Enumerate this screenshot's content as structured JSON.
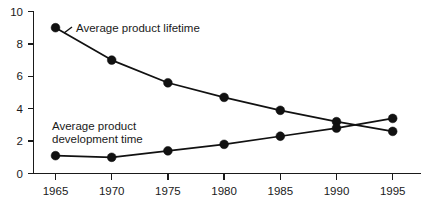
{
  "chart_data": {
    "type": "line",
    "title": "",
    "xlabel": "",
    "ylabel": "",
    "x": [
      1965,
      1970,
      1975,
      1980,
      1985,
      1990,
      1995
    ],
    "xtick_labels": [
      "1965",
      "1970",
      "1975",
      "1980",
      "1985",
      "1990",
      "1995"
    ],
    "ytick_labels": [
      "0",
      "2",
      "4",
      "6",
      "8",
      "10"
    ],
    "yticks": [
      0,
      2,
      4,
      6,
      8,
      10
    ],
    "ylim": [
      0,
      10
    ],
    "xlim": [
      1965,
      1995
    ],
    "grid": false,
    "legend_position": "inline-annotations",
    "series": [
      {
        "name": "Average product lifetime",
        "values": [
          9.0,
          7.0,
          5.6,
          4.7,
          3.9,
          3.2,
          2.6
        ]
      },
      {
        "name": "Average product development time",
        "values": [
          1.1,
          1.0,
          1.4,
          1.8,
          2.3,
          2.8,
          3.4
        ]
      }
    ],
    "annotations": [
      {
        "id": "lifetime-label",
        "text": "Average product lifetime",
        "lines": [
          "Average product lifetime"
        ]
      },
      {
        "id": "development-label",
        "text": "Average product development time",
        "lines": [
          "Average product",
          "development time"
        ]
      }
    ],
    "colors": {
      "line": "#111111",
      "marker": "#111111",
      "axis": "#1a1a1a",
      "text": "#1a1a1a",
      "background": "#ffffff"
    }
  }
}
